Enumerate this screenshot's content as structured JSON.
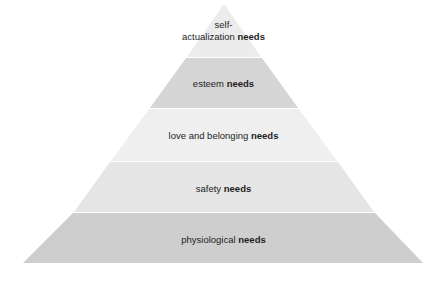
{
  "diagram": {
    "type": "pyramid",
    "title": "",
    "apex": {
      "x": 224,
      "y": 4
    },
    "base": {
      "left": 23,
      "right": 423,
      "y": 263
    },
    "layers": [
      {
        "id": "self-actualization",
        "text_line1": "self-",
        "text_line2_plain": "actualization ",
        "text_bold": "needs",
        "top": 4,
        "bottom": 57,
        "fill": "#ececec"
      },
      {
        "id": "esteem",
        "text_plain": "esteem ",
        "text_bold": "needs",
        "top": 58,
        "bottom": 108,
        "fill": "#d5d5d5"
      },
      {
        "id": "love-belonging",
        "text_plain": "love and belonging ",
        "text_bold": "needs",
        "top": 109,
        "bottom": 161,
        "fill": "#efefef"
      },
      {
        "id": "safety",
        "text_plain": "safety ",
        "text_bold": "needs",
        "top": 162,
        "bottom": 212,
        "fill": "#e5e5e5"
      },
      {
        "id": "physiological",
        "text_plain": "physiological ",
        "text_bold": "needs",
        "top": 213,
        "bottom": 263,
        "fill": "#cecece"
      }
    ]
  }
}
